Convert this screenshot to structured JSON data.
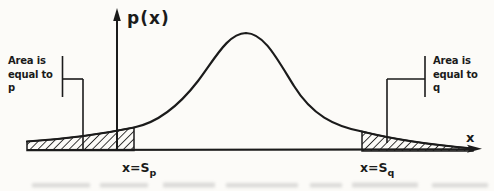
{
  "figure": {
    "y_axis_label": "p(x)",
    "x_axis_label": "x",
    "annotations": {
      "left": {
        "line1": "Area is",
        "line2": "equal to",
        "line3": "p"
      },
      "right": {
        "line1": "Area is",
        "line2": "equal to",
        "line3": "q"
      }
    },
    "boundary_labels": {
      "left": {
        "main": "x=S",
        "sub": "p"
      },
      "right": {
        "main": "x=S",
        "sub": "q"
      }
    },
    "colors": {
      "ink": "#1b1b1b",
      "paper": "#fcfbf8"
    }
  }
}
